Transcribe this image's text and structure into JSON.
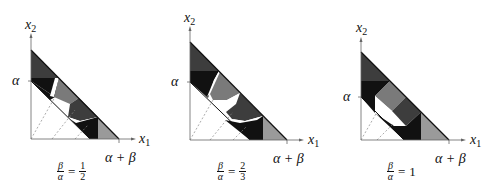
{
  "figure": {
    "panels": [
      {
        "id": "ratio-half",
        "y_axis_label": "x",
        "y_axis_sub": "2",
        "x_axis_label": "x",
        "x_axis_sub": "1",
        "alpha_tick": "α",
        "sum_tick": "α + β",
        "ratio_lhs_num": "β",
        "ratio_lhs_den": "α",
        "ratio_eq": "=",
        "ratio_rhs_num": "1",
        "ratio_rhs_den": "2"
      },
      {
        "id": "ratio-two-thirds",
        "y_axis_label": "x",
        "y_axis_sub": "2",
        "x_axis_label": "x",
        "x_axis_sub": "1",
        "alpha_tick": "α",
        "sum_tick": "α + β",
        "ratio_lhs_num": "β",
        "ratio_lhs_den": "α",
        "ratio_eq": "=",
        "ratio_rhs_num": "2",
        "ratio_rhs_den": "3"
      },
      {
        "id": "ratio-one",
        "y_axis_label": "x",
        "y_axis_sub": "2",
        "x_axis_label": "x",
        "x_axis_sub": "1",
        "alpha_tick": "α",
        "sum_tick": "α + β",
        "ratio_lhs_num": "β",
        "ratio_lhs_den": "α",
        "ratio_eq": "=",
        "ratio_rhs": "1"
      }
    ],
    "colors": {
      "black": "#111111",
      "dark_gray": "#3d3d3d",
      "mid_gray": "#7a7a7a",
      "light_gray": "#9a9a9a",
      "axis": "#666666"
    }
  }
}
